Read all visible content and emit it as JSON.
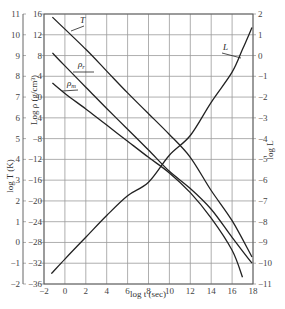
{
  "chart_data": {
    "type": "line",
    "title": "",
    "xlabel": "log t (sec)",
    "xlim": [
      -2,
      18
    ],
    "xticks": [
      -2,
      0,
      2,
      4,
      6,
      8,
      10,
      12,
      14,
      16,
      18
    ],
    "grid": true,
    "axes": {
      "left_outer": {
        "label": "log T (K)",
        "ticks": [
          11,
          10,
          9,
          8,
          7,
          6,
          5,
          4,
          3,
          2,
          1,
          0,
          -1,
          -2
        ],
        "range": [
          -2,
          11
        ]
      },
      "left_inner": {
        "label": "Log ρ (g/cm³)",
        "ticks": [
          16,
          12,
          8,
          4,
          0,
          -4,
          -8,
          -12,
          -16,
          -20,
          -24,
          -28,
          -32,
          -36
        ],
        "range": [
          -36,
          16
        ]
      },
      "right": {
        "label": "log L",
        "ticks": [
          2,
          1,
          0,
          -1,
          -2,
          -3,
          -4,
          -5,
          -6,
          -7,
          -8,
          -9,
          -10,
          -11
        ],
        "range": [
          -11,
          2
        ]
      }
    },
    "series": [
      {
        "name": "T",
        "axis": "left_outer",
        "points": [
          [
            -1.2,
            10.85
          ],
          [
            2,
            9.3
          ],
          [
            4,
            8.25
          ],
          [
            6,
            7.2
          ],
          [
            8,
            6.2
          ],
          [
            10,
            5.2
          ],
          [
            12,
            4.1
          ],
          [
            14,
            2.5
          ],
          [
            16,
            1.05
          ],
          [
            17.9,
            -0.7
          ]
        ]
      },
      {
        "name": "ρr",
        "label_main": "ρ",
        "label_sub": "r",
        "axis": "left_inner",
        "points": [
          [
            -1.2,
            8.5
          ],
          [
            0,
            6.0
          ],
          [
            2,
            1.9
          ],
          [
            4,
            -2.2
          ],
          [
            6,
            -6.2
          ],
          [
            8,
            -10.2
          ],
          [
            10,
            -14.3
          ],
          [
            12,
            -17.6
          ],
          [
            14,
            -21.6
          ],
          [
            16,
            -27.0
          ],
          [
            17.9,
            -32.0
          ]
        ]
      },
      {
        "name": "ρm",
        "label_main": "ρ",
        "label_sub": "m",
        "axis": "left_inner",
        "points": [
          [
            -1.2,
            2.7
          ],
          [
            0,
            0.7
          ],
          [
            2,
            -2.3
          ],
          [
            4,
            -5.4
          ],
          [
            6,
            -8.5
          ],
          [
            8,
            -11.6
          ],
          [
            10,
            -14.6
          ],
          [
            12,
            -18.4
          ],
          [
            14,
            -23.3
          ],
          [
            16,
            -29.5
          ],
          [
            17,
            -34.7
          ]
        ]
      },
      {
        "name": "L",
        "axis": "right",
        "points": [
          [
            -1.3,
            -10.5
          ],
          [
            0,
            -9.8
          ],
          [
            2,
            -8.75
          ],
          [
            4,
            -7.7
          ],
          [
            6,
            -6.75
          ],
          [
            8,
            -6.1
          ],
          [
            10,
            -4.8
          ],
          [
            12,
            -3.85
          ],
          [
            14,
            -2.25
          ],
          [
            16,
            -0.8
          ],
          [
            17,
            0.3
          ],
          [
            17.9,
            1.35
          ]
        ]
      }
    ],
    "annotations": [
      {
        "text": "T",
        "target": "T"
      },
      {
        "text": "ρr",
        "target": "ρr"
      },
      {
        "text": "ρm",
        "target": "ρm"
      },
      {
        "text": "L",
        "target": "L"
      }
    ],
    "legend": "none (inline curve labels)"
  }
}
